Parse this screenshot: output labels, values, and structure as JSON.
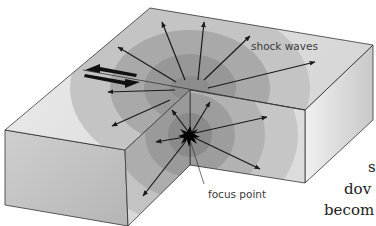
{
  "diagram": {
    "labels": {
      "shock_waves": "shock waves",
      "focus_point": "focus point"
    },
    "elements": [
      "block diagram of crust",
      "fault with opposing movement arrows",
      "concentric wave fronts",
      "radiating arrows",
      "focus star"
    ]
  },
  "clipped_text": {
    "line1": "s",
    "line2": "dov",
    "line3": "becom"
  },
  "colors": {
    "face_light": "#e6e6e6",
    "face_mid": "#bdbdbd",
    "wave_dark": "#8a8a8a",
    "outline": "#333333",
    "arrow": "#1a1a1a"
  }
}
